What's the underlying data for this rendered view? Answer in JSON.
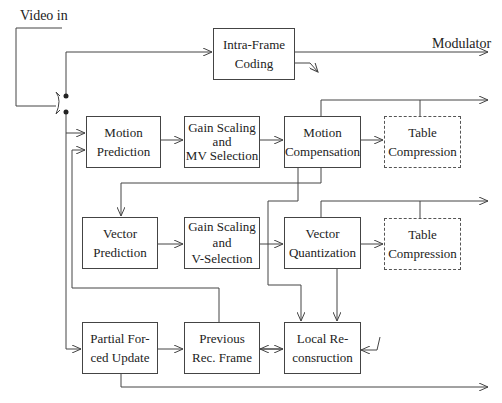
{
  "diagram": {
    "labels": {
      "video_in": "Video in",
      "modulator": "Modulator"
    },
    "blocks": {
      "intra_frame": [
        "Intra-Frame",
        "Coding"
      ],
      "motion_prediction": [
        "Motion",
        "Prediction"
      ],
      "gain_mv": [
        "Gain Scaling",
        "and",
        "MV Selection"
      ],
      "motion_compensation": [
        "Motion",
        "Compensation"
      ],
      "table_compression_1": [
        "Table",
        "Compression"
      ],
      "vector_prediction": [
        "Vector",
        "Prediction"
      ],
      "gain_v": [
        "Gain Scaling",
        "and",
        "V-Selection"
      ],
      "vector_quantization": [
        "Vector",
        "Quantization"
      ],
      "table_compression_2": [
        "Table",
        "Compression"
      ],
      "partial_update": [
        "Partial For-",
        "ced Update"
      ],
      "previous_frame": [
        "Previous",
        "Rec. Frame"
      ],
      "local_reconstruction": [
        "Local Re-",
        "consruction"
      ]
    },
    "colors": {
      "line": "#444444",
      "background": "#ffffff"
    }
  }
}
